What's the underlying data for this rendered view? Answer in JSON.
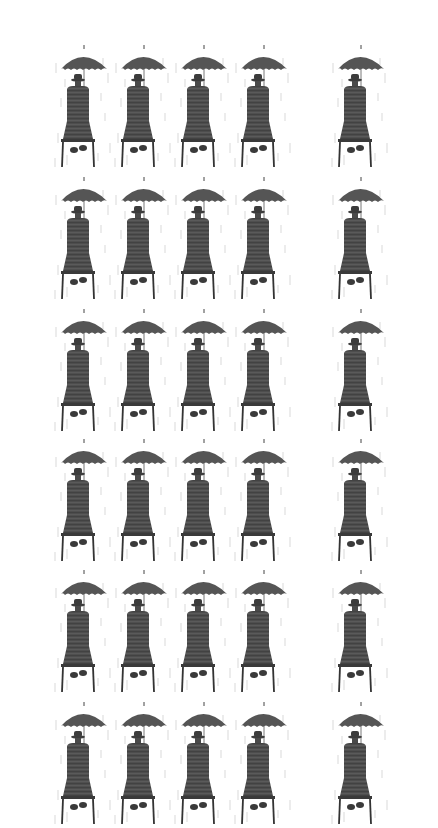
{
  "image": {
    "description": "Repeating tiled pattern of a sketched figure in a hat and coat sitting on a stool, seen from behind, holding an umbrella in the rain",
    "background_color": "#ffffff",
    "figure_color": "#4a4a4a",
    "rain_color": "#c8c8c8",
    "columns_x": [
      53,
      113,
      173,
      233,
      330
    ],
    "rows_y": [
      -130,
      43,
      175,
      307,
      437,
      568,
      700
    ],
    "tile_width": 60,
    "tile_height": 130,
    "figure_icon": "man-with-umbrella-on-stool"
  }
}
